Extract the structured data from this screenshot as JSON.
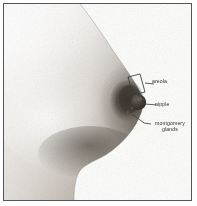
{
  "figure": {
    "view": "lateral / side profile, facing right",
    "medium": "grayscale photograph with printed annotation labels",
    "background_color": "#fdfdfd",
    "frame_color": "#55565a",
    "ink_color": "#2b2b2d"
  },
  "labels": [
    {
      "id": "areola",
      "text": "areola",
      "pointer": "bracket",
      "description": "small outlined parallelogram box drawn over the pigmented areola, joined to the text by a short leader line"
    },
    {
      "id": "nipple",
      "text": "nipple",
      "pointer": "line",
      "description": "short horizontal leader line to the nipple tip"
    },
    {
      "id": "montgomery",
      "text": "montgomery glands",
      "line1": "montgomery",
      "line2": "glands",
      "pointer": "line",
      "description": "leader line angling up-left to the lower border of the areola"
    }
  ],
  "tones": {
    "highlight": "#fbfbfa",
    "light": "#eceae7",
    "mid": "#c9c5c0",
    "shade": "#9a948d",
    "dark": "#6d665f",
    "areola": "#4a443e",
    "deep_shadow": "#3a352f"
  }
}
